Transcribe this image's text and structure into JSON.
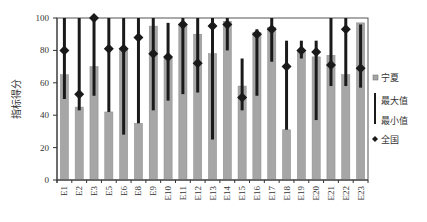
{
  "chart_data": {
    "type": "bar",
    "title": "",
    "xlabel": "",
    "ylabel": "指标得分",
    "ylim": [
      0,
      100
    ],
    "yticks": [
      0,
      20,
      40,
      60,
      80,
      100
    ],
    "yticks_labels": [
      "0",
      "20",
      "40",
      "60",
      "80",
      "100"
    ],
    "grid": false,
    "legend_position": "right",
    "categories": [
      "E1",
      "E2",
      "E3",
      "E5",
      "E6",
      "E8",
      "E9",
      "E10",
      "E11",
      "E12",
      "E13",
      "E14",
      "E15",
      "E16",
      "E17",
      "E18",
      "E19",
      "E20",
      "E21",
      "E22",
      "E23"
    ],
    "series": [
      {
        "name": "宁夏",
        "kind": "bar",
        "color": "#a6a6a6",
        "values": [
          65,
          45,
          70,
          42,
          81,
          35,
          95,
          75,
          96,
          90,
          78,
          98,
          58,
          91,
          94,
          31,
          80,
          76,
          77,
          65,
          97
        ]
      },
      {
        "name": "最大值",
        "kind": "range-max",
        "color": "#1a1a1a",
        "values": [
          100,
          100,
          100,
          100,
          100,
          100,
          100,
          97,
          100,
          100,
          100,
          100,
          75,
          93,
          100,
          86,
          86,
          86,
          100,
          100,
          96
        ]
      },
      {
        "name": "最小值",
        "kind": "range-min",
        "color": "#1a1a1a",
        "values": [
          50,
          43,
          52,
          42,
          28,
          35,
          43,
          49,
          53,
          54,
          25,
          80,
          43,
          52,
          73,
          31,
          75,
          37,
          58,
          58,
          57
        ]
      },
      {
        "name": "全国",
        "kind": "marker",
        "color": "#1a1a1a",
        "values": [
          80,
          53,
          100,
          81,
          81,
          88,
          78,
          76,
          96,
          72,
          95,
          96,
          51,
          90,
          93,
          70,
          80,
          79,
          71,
          93,
          69
        ]
      }
    ],
    "legend": [
      {
        "label": "宁夏",
        "symbol": "square"
      },
      {
        "label": "最大值",
        "symbol": "line"
      },
      {
        "label": "最小值",
        "symbol": "line"
      },
      {
        "label": "全国",
        "symbol": "diamond"
      }
    ]
  }
}
